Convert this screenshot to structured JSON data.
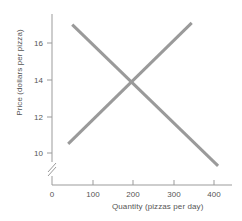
{
  "chart_data": {
    "type": "line",
    "title": "",
    "subtitle": "",
    "xlabel": "Quantity (pizzas per day)",
    "ylabel": "Price (dollars per pizza)",
    "xlim": [
      0,
      460
    ],
    "ylim": [
      9,
      17.6
    ],
    "y_axis_break": true,
    "grid": false,
    "legend": "none",
    "xticks": [
      0,
      100,
      200,
      300,
      400
    ],
    "xtick_labels": [
      "0",
      "100",
      "200",
      "300",
      "400"
    ],
    "yticks": [
      10,
      12,
      14,
      16
    ],
    "ytick_labels": [
      "10",
      "12",
      "14",
      "16"
    ],
    "series": [
      {
        "name": "Demand",
        "color": "#9a9a9a",
        "points": [
          {
            "x": 50,
            "y": 17.0
          },
          {
            "x": 410,
            "y": 9.3
          }
        ]
      },
      {
        "name": "Supply",
        "color": "#9a9a9a",
        "points": [
          {
            "x": 40,
            "y": 10.5
          },
          {
            "x": 345,
            "y": 17.1
          }
        ]
      }
    ],
    "annotations": [
      {
        "label": "equilibrium",
        "x": 200,
        "y": 14.0
      }
    ]
  },
  "axes": {
    "line_color": "#9b9b9b",
    "tick_color": "#9b9b9b",
    "text_color": "#555555"
  }
}
